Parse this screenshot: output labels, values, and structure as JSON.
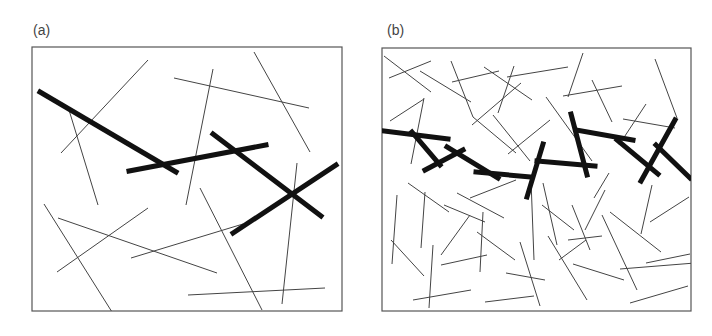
{
  "figure": {
    "colors": {
      "frame": "#555555",
      "thin_line": "#444444",
      "thick_line": "#111111",
      "label": "#444444"
    },
    "panels": [
      {
        "id": "a",
        "label": "(a)",
        "label_pos": [
          33,
          23
        ],
        "frame": {
          "x": 32,
          "y": 47,
          "w": 310,
          "h": 264
        },
        "thin_lines": [
          [
            69,
            110,
            98,
            205
          ],
          [
            61,
            153,
            148,
            60
          ],
          [
            174,
            78,
            309,
            108
          ],
          [
            213,
            69,
            186,
            205
          ],
          [
            254,
            52,
            310,
            152
          ],
          [
            44,
            204,
            112,
            312
          ],
          [
            58,
            218,
            217,
            273
          ],
          [
            57,
            272,
            148,
            208
          ],
          [
            131,
            258,
            243,
            224
          ],
          [
            200,
            188,
            262,
            310
          ],
          [
            297,
            163,
            282,
            304
          ],
          [
            188,
            295,
            325,
            288
          ]
        ],
        "thick_lines": [
          [
            40,
            92,
            176,
            172
          ],
          [
            129,
            171,
            266,
            145
          ],
          [
            213,
            134,
            321,
            216
          ],
          [
            233,
            233,
            336,
            165
          ]
        ]
      },
      {
        "id": "b",
        "label": "(b)",
        "label_pos": [
          387,
          23
        ],
        "frame": {
          "x": 382,
          "y": 48,
          "w": 309,
          "h": 263
        },
        "thin_lines": [
          [
            384,
            56,
            431,
            92
          ],
          [
            389,
            78,
            431,
            61
          ],
          [
            420,
            71,
            471,
            102
          ],
          [
            451,
            61,
            473,
            117
          ],
          [
            452,
            82,
            499,
            71
          ],
          [
            484,
            67,
            532,
            100
          ],
          [
            507,
            77,
            568,
            67
          ],
          [
            514,
            66,
            498,
            113
          ],
          [
            390,
            121,
            424,
            99
          ],
          [
            424,
            98,
            411,
            164
          ],
          [
            493,
            115,
            530,
            161
          ],
          [
            472,
            125,
            521,
            83
          ],
          [
            473,
            117,
            516,
            153
          ],
          [
            508,
            154,
            550,
            120
          ],
          [
            546,
            97,
            592,
            161
          ],
          [
            583,
            53,
            568,
            97
          ],
          [
            563,
            96,
            622,
            86
          ],
          [
            592,
            80,
            612,
            122
          ],
          [
            623,
            119,
            675,
            128
          ],
          [
            646,
            104,
            619,
            145
          ],
          [
            655,
            59,
            677,
            118
          ],
          [
            408,
            183,
            449,
            212
          ],
          [
            397,
            195,
            392,
            264
          ],
          [
            425,
            192,
            421,
            248
          ],
          [
            444,
            205,
            485,
            222
          ],
          [
            457,
            193,
            504,
            218
          ],
          [
            470,
            198,
            516,
            180
          ],
          [
            391,
            240,
            424,
            276
          ],
          [
            433,
            245,
            429,
            308
          ],
          [
            441,
            255,
            470,
            215
          ],
          [
            441,
            265,
            487,
            255
          ],
          [
            483,
            212,
            480,
            272
          ],
          [
            477,
            232,
            515,
            260
          ],
          [
            413,
            300,
            471,
            290
          ],
          [
            485,
            302,
            534,
            296
          ],
          [
            520,
            242,
            540,
            306
          ],
          [
            506,
            273,
            545,
            280
          ],
          [
            531,
            180,
            534,
            260
          ],
          [
            542,
            205,
            574,
            230
          ],
          [
            568,
            240,
            602,
            236
          ],
          [
            572,
            205,
            590,
            250
          ],
          [
            594,
            198,
            609,
            173
          ],
          [
            610,
            212,
            661,
            252
          ],
          [
            652,
            185,
            641,
            234
          ],
          [
            646,
            263,
            690,
            254
          ],
          [
            630,
            303,
            688,
            286
          ],
          [
            559,
            260,
            586,
            240
          ],
          [
            548,
            236,
            587,
            300
          ],
          [
            573,
            264,
            624,
            280
          ],
          [
            602,
            215,
            637,
            290
          ],
          [
            650,
            222,
            689,
            197
          ],
          [
            620,
            269,
            695,
            263
          ],
          [
            543,
            183,
            557,
            245
          ],
          [
            585,
            230,
            605,
            190
          ]
        ],
        "thick_lines": [
          [
            384,
            131,
            448,
            139
          ],
          [
            412,
            132,
            440,
            165
          ],
          [
            425,
            170,
            463,
            150
          ],
          [
            447,
            147,
            498,
            178
          ],
          [
            476,
            172,
            531,
            177
          ],
          [
            543,
            144,
            527,
            197
          ],
          [
            537,
            161,
            595,
            166
          ],
          [
            571,
            114,
            587,
            175
          ],
          [
            576,
            130,
            633,
            140
          ],
          [
            617,
            140,
            658,
            174
          ],
          [
            675,
            120,
            641,
            181
          ],
          [
            656,
            145,
            690,
            178
          ]
        ]
      }
    ]
  }
}
